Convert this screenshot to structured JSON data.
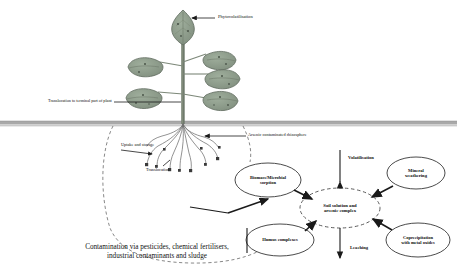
{
  "diagram": {
    "soil_line_y": 124,
    "colors": {
      "leaf_fill": "#8c9b8a",
      "leaf_stroke": "#5f6b5e",
      "stem": "#6f7a6c",
      "soil_band": "#a8a8a8",
      "ellipse_stroke": "#2b2b2b",
      "arrow": "#1a1a1a",
      "dashed": "#555555",
      "text": "#111111"
    },
    "annotations": [
      {
        "id": "phytovolatilisation",
        "label": "Phytovolatilisation",
        "x": 218,
        "y": 14,
        "size": 4.6
      },
      {
        "id": "translocation-terminal",
        "label": "Translocation to terminal part of plant",
        "x": 48,
        "y": 99,
        "size": 4.2
      },
      {
        "id": "uptake-storage",
        "label": "Uptake and storage",
        "x": 121,
        "y": 143,
        "size": 4.3
      },
      {
        "id": "translocation",
        "label": "Translocation",
        "x": 146,
        "y": 168,
        "size": 4.3
      },
      {
        "id": "arsenic-rhizosphere",
        "label": "Arsenic contaminated rhizosphere",
        "x": 248,
        "y": 133,
        "size": 4.3
      },
      {
        "id": "volatilisation",
        "label": "Volatilisation",
        "x": 348,
        "y": 155,
        "size": 4.6
      },
      {
        "id": "leaching",
        "label": "Leaching",
        "x": 350,
        "y": 245,
        "size": 4.6
      }
    ],
    "nodes": [
      {
        "id": "biomass-microbial-sorption",
        "lines": [
          "Biomass/Microbial",
          "sorption"
        ],
        "cx": 268,
        "cy": 180,
        "rx": 33,
        "ry": 17,
        "size": 4.5
      },
      {
        "id": "soil-solution-arsenic-complex",
        "lines": [
          "Soil solution and",
          "arsenic complex"
        ],
        "cx": 340,
        "cy": 208,
        "rx": 40,
        "ry": 20,
        "size": 4.7,
        "dashed": true
      },
      {
        "id": "mineral-weathering",
        "lines": [
          "Mineral",
          "weathering"
        ],
        "cx": 416,
        "cy": 173,
        "rx": 29,
        "ry": 16,
        "size": 4.6
      },
      {
        "id": "coprecipitation-metal-oxides",
        "lines": [
          "Coprecipitation",
          "with metal oxides"
        ],
        "cx": 418,
        "cy": 240,
        "rx": 32,
        "ry": 17,
        "size": 4.5
      },
      {
        "id": "humus-complexes",
        "lines": [
          "Humus complexes"
        ],
        "cx": 280,
        "cy": 240,
        "rx": 34,
        "ry": 16,
        "size": 4.6
      }
    ],
    "bottom_caption": {
      "id": "contamination-caption",
      "line1": "Contamination via pesticides, chemical fertilisers,",
      "line2": "industrial contaminants and sludge",
      "x": 67,
      "y": 243,
      "width": 180,
      "size": 7.2
    }
  }
}
